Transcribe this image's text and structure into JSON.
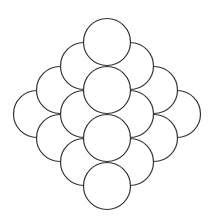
{
  "diagram": {
    "type": "circle-packing-diamond",
    "stroke_color": "#333333",
    "fill_color": "#ffffff",
    "radius": 23.5,
    "stroke_width": 1.2,
    "circles": [
      {
        "cx": 37,
        "cy": 114,
        "layer": 0
      },
      {
        "cx": 177,
        "cy": 114,
        "layer": 0
      },
      {
        "cx": 60,
        "cy": 90,
        "layer": 1
      },
      {
        "cx": 60,
        "cy": 138,
        "layer": 1
      },
      {
        "cx": 154,
        "cy": 90,
        "layer": 1
      },
      {
        "cx": 154,
        "cy": 138,
        "layer": 1
      },
      {
        "cx": 84,
        "cy": 66,
        "layer": 2
      },
      {
        "cx": 84,
        "cy": 114,
        "layer": 2
      },
      {
        "cx": 84,
        "cy": 162,
        "layer": 2
      },
      {
        "cx": 130,
        "cy": 66,
        "layer": 2
      },
      {
        "cx": 130,
        "cy": 114,
        "layer": 2
      },
      {
        "cx": 130,
        "cy": 162,
        "layer": 2
      },
      {
        "cx": 107,
        "cy": 42,
        "layer": 3
      },
      {
        "cx": 107,
        "cy": 90,
        "layer": 3
      },
      {
        "cx": 107,
        "cy": 138,
        "layer": 3
      },
      {
        "cx": 107,
        "cy": 186,
        "layer": 3
      }
    ]
  },
  "caption": {
    "text": ""
  }
}
